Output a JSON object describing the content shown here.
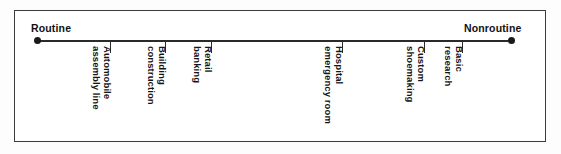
{
  "figure": {
    "type": "continuum-scale",
    "background_color": "#ffffff",
    "frame_color": "#3c3c3c",
    "axis_color": "#2a2a2a",
    "text_color": "#151515"
  },
  "axis": {
    "left_endpoint_label": "Routine",
    "right_endpoint_label": "Nonroutine",
    "left_endpoint_marker": "filled-dot",
    "right_endpoint_marker": "filled-dot"
  },
  "chart_data": {
    "type": "scatter",
    "title": "",
    "subtitle": "",
    "xlabel": "",
    "ylabel": "",
    "orientation": "horizontal-continuum",
    "grid": false,
    "legend": "none",
    "axis_endpoints": [
      "Routine",
      "Nonroutine"
    ],
    "categories": [
      "Automobile assembly line",
      "Building construction",
      "Retail banking",
      "Hospital emergency room",
      "Custom shoemaking",
      "Basic research"
    ],
    "x": [
      15.3,
      26.9,
      36.6,
      64.1,
      81.3,
      89.3
    ],
    "values": [
      15.3,
      26.9,
      36.6,
      64.1,
      81.3,
      89.3
    ],
    "xlim": [
      0,
      100
    ],
    "units": "percent of continuum from Routine (0) to Nonroutine (100)"
  },
  "ticks": [
    {
      "name": "automobile-assembly-line",
      "line1": "Automobile",
      "line2": "assembly line",
      "x_px": 110
    },
    {
      "name": "building-construction",
      "line1": "Building",
      "line2": "construction",
      "x_px": 165
    },
    {
      "name": "retail-banking",
      "line1": "Retail",
      "line2": "banking",
      "x_px": 211
    },
    {
      "name": "hospital-emergency-room",
      "line1": "Hospital",
      "line2": "emergency room",
      "x_px": 342
    },
    {
      "name": "custom-shoemaking",
      "line1": "Custom",
      "line2": "shoemaking",
      "x_px": 424
    },
    {
      "name": "basic-research",
      "line1": "Basic",
      "line2": "research",
      "x_px": 462
    }
  ]
}
